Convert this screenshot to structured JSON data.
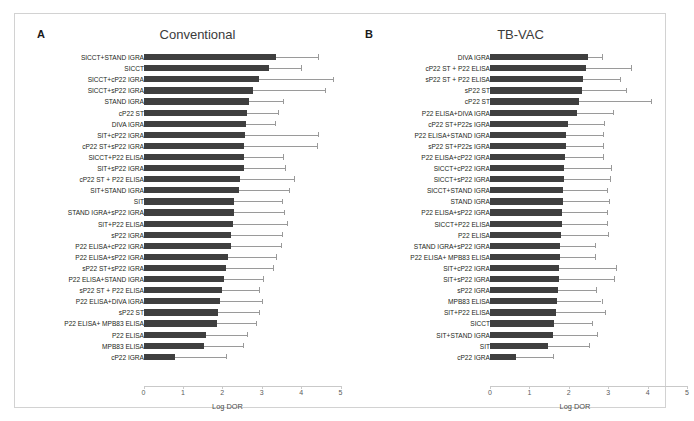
{
  "figure": {
    "axis_label": "Log DOR",
    "tick_labels": [
      "0",
      "1",
      "2",
      "3",
      "4",
      "5"
    ],
    "bar_color": "#3f3f3f",
    "whisker_color": "#9a9a9a",
    "frame_color": "#d2d2d2"
  },
  "chart_data": [
    {
      "type": "bar",
      "panel_letter": "A",
      "title": "Conventional",
      "orientation": "horizontal",
      "xlabel": "Log DOR",
      "ylabel": "",
      "xlim": [
        0,
        5
      ],
      "xticks": [
        0,
        1,
        2,
        3,
        4,
        5
      ],
      "grid": false,
      "legend": "none",
      "categories": [
        "SICCT+STAND IGRA",
        "SICCT",
        "SICCT+cP22 IGRA",
        "SICCT+sP22 IGRA",
        "STAND IGRA",
        "cP22 ST",
        "DIVA IGRA",
        "SIT+cP22 IGRA",
        "cP22 ST+sP22 IGRA",
        "SICCT+P22 ELISA",
        "SIT+sP22 IGRA",
        "cP22 ST + P22 ELISA",
        "SIT+STAND IGRA",
        "SIT",
        "STAND IGRA+sP22 IGRA",
        "SIT+P22 ELISA",
        "sP22 IGRA",
        "P22 ELISA+cP22 IGRA",
        "P22 ELISA+sP22 IGRA",
        "sP22 ST+sP22 IGRA",
        "P22 ELISA+STAND IGRA",
        "sP22 ST + P22 ELISA",
        "P22 ELISA+DIVA IGRA",
        "sP22 ST",
        "P22 ELISA+ MPB83 ELISA",
        "P22 ELISA",
        "MPB83 ELISA",
        "cP22 IGRA"
      ],
      "values": [
        3.37,
        3.18,
        2.93,
        2.78,
        2.68,
        2.63,
        2.6,
        2.58,
        2.56,
        2.55,
        2.54,
        2.45,
        2.43,
        2.3,
        2.3,
        2.28,
        2.22,
        2.21,
        2.15,
        2.1,
        2.05,
        1.99,
        1.94,
        1.88,
        1.86,
        1.58,
        1.53,
        0.79
      ],
      "ci_upper": [
        4.44,
        4.0,
        4.82,
        4.6,
        3.55,
        3.42,
        3.34,
        4.43,
        4.4,
        3.53,
        3.6,
        3.83,
        3.7,
        3.52,
        3.56,
        3.63,
        3.51,
        3.49,
        3.37,
        3.28,
        3.03,
        2.92,
        3.02,
        2.93,
        2.86,
        2.63,
        2.52,
        2.1
      ]
    },
    {
      "type": "bar",
      "panel_letter": "B",
      "title": "TB-VAC",
      "orientation": "horizontal",
      "xlabel": "Log DOR",
      "ylabel": "",
      "xlim": [
        0,
        5
      ],
      "xticks": [
        0,
        1,
        2,
        3,
        4,
        5
      ],
      "grid": false,
      "legend": "none",
      "categories": [
        "DIVA IGRA",
        "cP22 ST + P22 ELISA",
        "sP22 ST + P22 ELISA",
        "sP22 ST",
        "cP22 ST",
        "P22 ELISA+DIVA IGRA",
        "cP22 ST+P22s IGRA",
        "P22 ELISA+STAND IGRA",
        "sP22 ST+P22s IGRA",
        "P22 ELISA+cP22 IGRA",
        "SICCT+cP22 IGRA",
        "SICCT+sP22 IGRA",
        "SICCT+STAND IGRA",
        "STAND IGRA",
        "P22 ELISA+sP22 IGRA",
        "SICCT+P22 ELISA",
        "P22 ELISA",
        "STAND IGRA+sP22 IGRA",
        "P22 ELISA+ MPB83 ELISA",
        "SIT+cP22 IGRA",
        "SIT+sP22 IGRA",
        "sP22 IGRA",
        "MPB83 ELISA",
        "SIT+P22 ELISA",
        "SICCT",
        "SIT+STAND IGRA",
        "SIT",
        "cP22 IGRA"
      ],
      "values": [
        2.48,
        2.44,
        2.37,
        2.33,
        2.26,
        2.22,
        1.97,
        1.93,
        1.92,
        1.9,
        1.89,
        1.88,
        1.86,
        1.85,
        1.83,
        1.82,
        1.8,
        1.78,
        1.77,
        1.76,
        1.74,
        1.72,
        1.69,
        1.68,
        1.62,
        1.59,
        1.47,
        0.66
      ],
      "ci_upper": [
        2.85,
        3.57,
        3.31,
        3.45,
        4.08,
        3.12,
        2.9,
        2.88,
        2.88,
        2.88,
        3.06,
        3.04,
        2.97,
        3.03,
        2.97,
        2.96,
        3.0,
        2.67,
        2.66,
        3.19,
        3.15,
        2.7,
        2.83,
        2.92,
        2.58,
        2.72,
        2.52,
        1.61
      ]
    }
  ]
}
